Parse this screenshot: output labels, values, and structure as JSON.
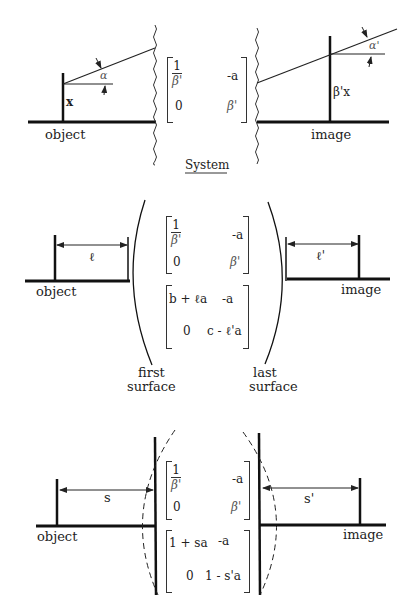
{
  "caption": "System",
  "panels": {
    "top": {
      "object_label": "object",
      "image_label": "image",
      "height_object": "x",
      "height_image": "β'x",
      "angle_object": "α",
      "angle_image": "α'",
      "matrix": {
        "r1c1_num": "1",
        "r1c1_den": "β'",
        "r1c2": "-a",
        "r2c1": "0",
        "r2c2": "β'"
      }
    },
    "middle": {
      "object_label": "object",
      "image_label": "image",
      "distance_object": "ℓ",
      "distance_image": "ℓ'",
      "first_surface_label_1": "first",
      "first_surface_label_2": "surface",
      "last_surface_label_1": "last",
      "last_surface_label_2": "surface",
      "matrix_system": {
        "r1c1_num": "1",
        "r1c1_den": "β'",
        "r1c2": "-a",
        "r2c1": "0",
        "r2c2": "β'"
      },
      "matrix_surfaces": {
        "r1c1": "b + ℓa",
        "r1c2": "-a",
        "r2c1": "0",
        "r2c2": "c - ℓ'a"
      }
    },
    "bottom": {
      "object_label": "object",
      "image_label": "image",
      "distance_object": "s",
      "distance_image": "s'",
      "matrix_system": {
        "r1c1_num": "1",
        "r1c1_den": "β'",
        "r1c2": "-a",
        "r2c1": "0",
        "r2c2": "β'"
      },
      "matrix_principal": {
        "r1c1": "1 + sa",
        "r1c2": "-a",
        "r2c1": "0",
        "r2c2": "1 - s'a"
      }
    }
  }
}
